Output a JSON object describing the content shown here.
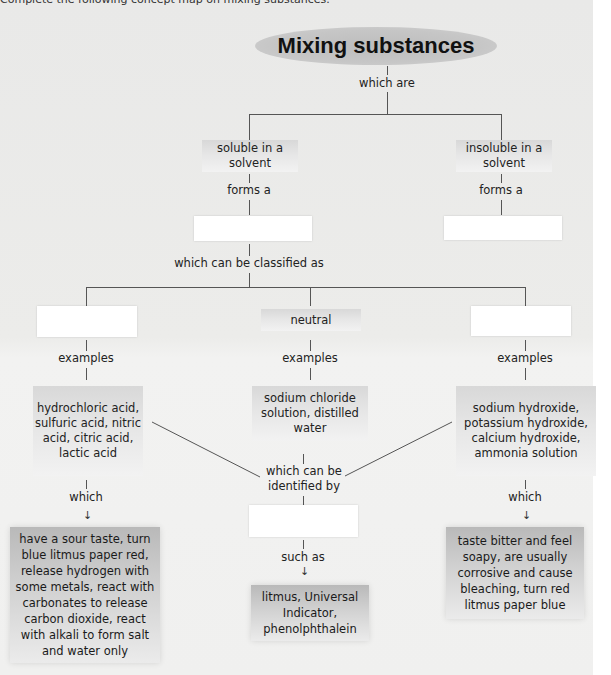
{
  "instruction": "Complete the following concept map on mixing substances.",
  "title": "Mixing substances",
  "links": {
    "which_are": "which are",
    "forms_a_left": "forms a",
    "forms_a_right": "forms a",
    "classified": "which can be classified as",
    "examples_left": "examples",
    "examples_mid": "examples",
    "examples_right": "examples",
    "which_left": "which",
    "which_right": "which",
    "identified_by": "which can be identified by",
    "such_as": "such as"
  },
  "nodes": {
    "soluble": "soluble in a solvent",
    "insoluble": "insoluble in a solvent",
    "blank_solution": "",
    "blank_suspension": "",
    "blank_acid": "",
    "neutral": "neutral",
    "blank_alkali": "",
    "blank_indicator": "",
    "acid_examples": "hydrochloric acid, sulfuric acid, nitric acid, citric acid, lactic acid",
    "neutral_examples": "sodium chloride solution, distilled water",
    "alkali_examples": "sodium hydroxide, potassium hydroxide, calcium hydroxide, ammonia solution",
    "acid_properties": "have a sour taste, turn blue litmus paper red, release hydrogen with some metals, react with carbonates to release carbon dioxide, react with alkali to form salt and water only",
    "indicator_examples": "litmus, Universal Indicator, phenolphthalein",
    "alkali_properties": "taste bitter and feel soapy, are usually corrosive and cause bleaching, turn red litmus paper blue"
  },
  "colors": {
    "line": "#555555",
    "blank_box": "#ffffff",
    "title_ellipse": "#c4c4c4",
    "page_bg": "#ebebea"
  }
}
